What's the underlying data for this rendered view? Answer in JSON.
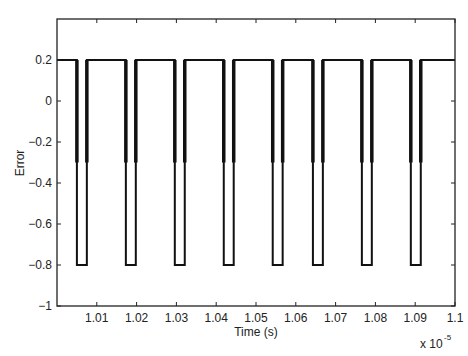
{
  "chart_data": {
    "type": "line",
    "title": "",
    "xlabel": "Time (s)",
    "ylabel": "Error",
    "x_multiplier": "x 10^-5",
    "x_multiplier_base": "x 10",
    "x_multiplier_exp": "-5",
    "xlim": [
      1.0,
      1.1
    ],
    "ylim": [
      -1,
      0.4
    ],
    "xticks": [
      1.01,
      1.02,
      1.03,
      1.04,
      1.05,
      1.06,
      1.07,
      1.08,
      1.09,
      1.1
    ],
    "xtick_labels": [
      "1.01",
      "1.02",
      "1.03",
      "1.04",
      "1.05",
      "1.06",
      "1.07",
      "1.08",
      "1.09",
      "1.1"
    ],
    "yticks": [
      0.2,
      0,
      -0.2,
      -0.4,
      -0.6,
      -0.8,
      -1
    ],
    "ytick_labels": [
      "0.2",
      "0",
      "−0.2",
      "−0.4",
      "−0.6",
      "−0.8",
      "−1"
    ],
    "grid": false,
    "legend": null,
    "line_color": "#111111",
    "baseline_value": 0.2,
    "pulse_low_value": -0.8,
    "edge_thick_until": -0.3,
    "pulses": [
      {
        "start": 1.005,
        "end": 1.0075
      },
      {
        "start": 1.0173,
        "end": 1.0198
      },
      {
        "start": 1.0296,
        "end": 1.0321
      },
      {
        "start": 1.0419,
        "end": 1.0444
      },
      {
        "start": 1.0542,
        "end": 1.0567
      },
      {
        "start": 1.0643,
        "end": 1.0668
      },
      {
        "start": 1.0766,
        "end": 1.0791
      },
      {
        "start": 1.0889,
        "end": 1.0914
      }
    ]
  }
}
